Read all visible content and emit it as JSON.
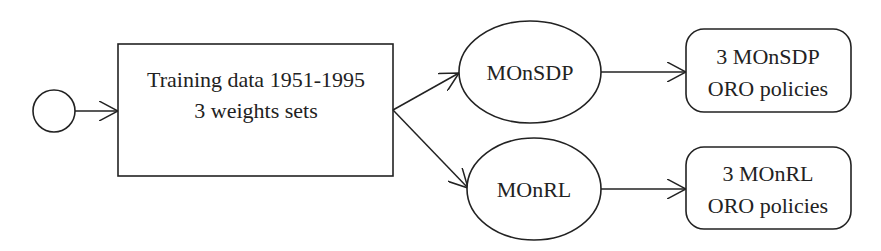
{
  "diagram": {
    "type": "flowchart",
    "colors": {
      "stroke": "#222222",
      "background": "#ffffff",
      "text": "#222222"
    },
    "nodes": {
      "start": {
        "shape": "circle",
        "label": ""
      },
      "training": {
        "shape": "rectangle",
        "line1": "Training data 1951-1995",
        "line2": "3 weights sets"
      },
      "monsdp": {
        "shape": "ellipse",
        "label": "MOnSDP"
      },
      "monrl": {
        "shape": "ellipse",
        "label": "MOnRL"
      },
      "monsdp_policies": {
        "shape": "rounded-rectangle",
        "line1": "3 MOnSDP",
        "line2": "ORO policies"
      },
      "monrl_policies": {
        "shape": "rounded-rectangle",
        "line1": "3 MOnRL",
        "line2": "ORO policies"
      }
    },
    "edges": [
      {
        "from": "start",
        "to": "training"
      },
      {
        "from": "training",
        "to": "monsdp"
      },
      {
        "from": "training",
        "to": "monrl"
      },
      {
        "from": "monsdp",
        "to": "monsdp_policies"
      },
      {
        "from": "monrl",
        "to": "monrl_policies"
      }
    ]
  }
}
